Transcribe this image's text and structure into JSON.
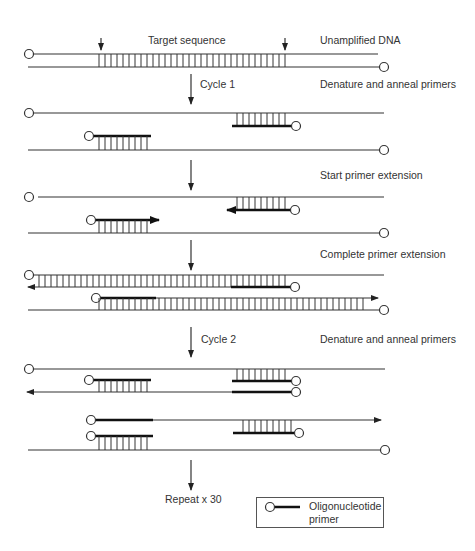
{
  "figure": {
    "labels": {
      "target_sequence": "Target sequence",
      "unamplified_dna": "Unamplified DNA",
      "cycle1": "Cycle 1",
      "denature_anneal_1": "Denature and anneal primers",
      "start_extension": "Start primer extension",
      "complete_extension": "Complete primer extension",
      "cycle2": "Cycle 2",
      "denature_anneal_2": "Denature and anneal primers",
      "repeat": "Repeat x 30"
    },
    "legend": {
      "symbol": "circle-with-thick-line",
      "text_line1": "Oligonucleotide",
      "text_line2": "primer"
    },
    "colors": {
      "strand": "#333333",
      "primer": "#111111",
      "text": "#333333",
      "background": "#ffffff"
    }
  }
}
